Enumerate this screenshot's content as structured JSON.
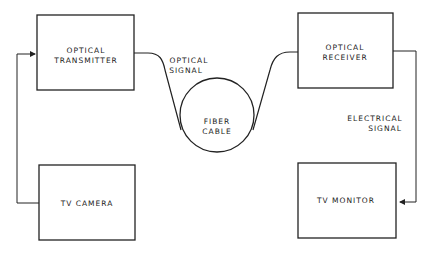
{
  "diagram": {
    "blocks": {
      "transmitter": {
        "line1": "OPTICAL",
        "line2": "TRANSMITTER"
      },
      "receiver": {
        "line1": "OPTICAL",
        "line2": "RECEIVER"
      },
      "camera": {
        "label": "TV CAMERA"
      },
      "monitor": {
        "label": "TV MONITOR"
      },
      "fiber": {
        "line1": "FIBER",
        "line2": "CABLE"
      }
    },
    "annotations": {
      "optical_signal": {
        "line1": "OPTICAL",
        "line2": "SIGNAL"
      },
      "electrical_signal": {
        "line1": "ELECTRICAL",
        "line2": "SIGNAL"
      }
    },
    "colors": {
      "stroke": "#222222",
      "background": "#ffffff"
    }
  }
}
